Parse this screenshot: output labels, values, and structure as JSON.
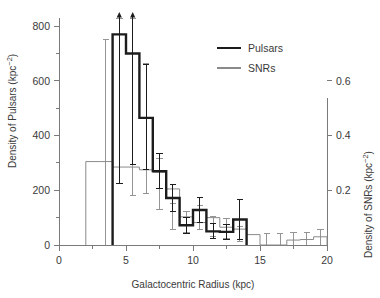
{
  "figure": {
    "background": "#ffffff",
    "pulsar_color": "#1c1c1c",
    "snr_color": "#8a8a8a",
    "axis_color": "#7a7a7a"
  },
  "chart_data": {
    "type": "bar",
    "title": "",
    "subtitle": "",
    "xlabel": "Galactocentric Radius (kpc)",
    "ylabel": "Density of Pulsars (kpc",
    "ylabel_sup": "−2",
    "ylabel_close": ")",
    "y2label": "Density of SNRs (kpc",
    "y2label_sup": "−2",
    "y2label_close": ")",
    "xlim": [
      0,
      20
    ],
    "ylim": [
      0,
      830
    ],
    "y2lim": [
      0,
      0.83
    ],
    "grid": false,
    "legend_position": "upper right",
    "xticks": [
      0,
      5,
      10,
      15,
      20
    ],
    "xticklabels": [
      "0",
      "5",
      "10",
      "15",
      "20"
    ],
    "xminorticks": [
      2.5,
      7.5,
      12.5,
      17.5
    ],
    "yticks": [
      0,
      200,
      400,
      600,
      800
    ],
    "yticklabels": [
      "0",
      "200",
      "400",
      "600",
      "800"
    ],
    "yminorticks": [
      100,
      300,
      500,
      700
    ],
    "y2ticks": [
      0.2,
      0.4,
      0.6
    ],
    "y2ticklabels": [
      "0.2",
      "0.4",
      "0.6"
    ],
    "bin_width": 1,
    "series": [
      {
        "name": "Pulsars",
        "axis": "left",
        "color": "#1c1c1c",
        "linewidth": 2.4,
        "bin_edges": [
          4,
          5,
          6,
          7,
          8,
          9,
          10,
          11,
          12,
          13,
          14
        ],
        "values": [
          770,
          700,
          465,
          270,
          172,
          72,
          128,
          50,
          48,
          93
        ],
        "errors_low": [
          545,
          405,
          190,
          65,
          48,
          30,
          45,
          28,
          28,
          72
        ],
        "errors_high": [
          560,
          430,
          195,
          65,
          48,
          30,
          45,
          28,
          28,
          72
        ],
        "arrow_bins": [
          0,
          1
        ],
        "arrow_note": "error bars on first two bins extend above plot limit"
      },
      {
        "name": "SNRs",
        "axis": "right",
        "color": "#8a8a8a",
        "linewidth": 1.0,
        "bin_edges": [
          2,
          3,
          4,
          5,
          6,
          7,
          8,
          9,
          10,
          11,
          12,
          13,
          14,
          15,
          16,
          17,
          18,
          19,
          20
        ],
        "values": [
          0.305,
          0.305,
          0.285,
          0.285,
          0.275,
          0.265,
          0.205,
          0.103,
          0.082,
          0.1,
          0.065,
          0.058,
          0.038,
          0.0,
          0.0,
          0.018,
          0.02,
          0.03
        ],
        "error_bars": [
          {
            "x": 3.5,
            "y": 0.305,
            "low": 0.305,
            "high": 0.445
          },
          {
            "x": 4.5,
            "y": 0.285,
            "low": 0.06,
            "high": 0.58
          },
          {
            "x": 5.5,
            "y": 0.285,
            "low": 0.105,
            "high": 0.56
          },
          {
            "x": 6.5,
            "y": 0.275,
            "low": 0.088,
            "high": 0.39
          },
          {
            "x": 7.5,
            "y": 0.205,
            "low": 0.075,
            "high": 0.11
          },
          {
            "x": 8.5,
            "y": 0.103,
            "low": 0.045,
            "high": 0.05
          },
          {
            "x": 9.5,
            "y": 0.082,
            "low": 0.038,
            "high": 0.04
          },
          {
            "x": 10.5,
            "y": 0.1,
            "low": 0.045,
            "high": 0.045
          },
          {
            "x": 11.5,
            "y": 0.065,
            "low": 0.035,
            "high": 0.038
          },
          {
            "x": 12.5,
            "y": 0.058,
            "low": 0.035,
            "high": 0.038
          },
          {
            "x": 13.5,
            "y": 0.038,
            "low": 0.025,
            "high": 0.028
          },
          {
            "x": 15.5,
            "y": 0.012,
            "low": 0.012,
            "high": 0.03
          },
          {
            "x": 16.5,
            "y": 0.012,
            "low": 0.012,
            "high": 0.03
          },
          {
            "x": 17.5,
            "y": 0.018,
            "low": 0.018,
            "high": 0.026
          },
          {
            "x": 18.5,
            "y": 0.02,
            "low": 0.02,
            "high": 0.026
          },
          {
            "x": 19.5,
            "y": 0.03,
            "low": 0.03,
            "high": 0.026
          }
        ]
      }
    ],
    "legend": [
      {
        "label": "Pulsars",
        "color": "#1c1c1c",
        "linewidth": 2.6
      },
      {
        "label": "SNRs",
        "color": "#8a8a8a",
        "linewidth": 1.1
      }
    ]
  }
}
